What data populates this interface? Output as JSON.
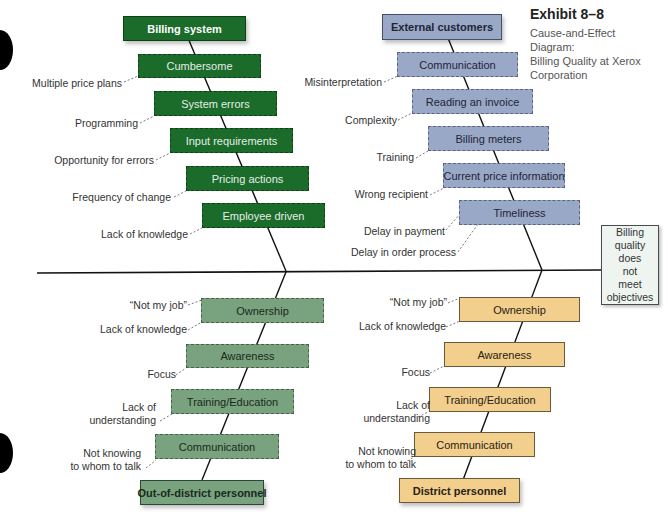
{
  "exhibit": {
    "number": "Exhibit 8–8",
    "caption_line1": "Cause-and-Effect Diagram:",
    "caption_line2": "Billing Quality at Xerox",
    "caption_line3": "Corporation"
  },
  "effect": {
    "lines": [
      "Billing",
      "quality",
      "does",
      "not",
      "meet",
      "objectives"
    ]
  },
  "colors": {
    "billing_system": "#1b6b2a",
    "external_customers": "#9aa8c8",
    "out_of_district": "#79a37e",
    "district": "#f2cf8c",
    "spine": "#111111"
  },
  "branches": {
    "billing_system": {
      "title": "Billing system",
      "categories": [
        "Cumbersome",
        "System errors",
        "Input requirements",
        "Pricing actions",
        "Employee driven"
      ],
      "causes": [
        "Multiple price plans",
        "Programming",
        "Opportunity for errors",
        "Frequency of change",
        "Lack of knowledge"
      ]
    },
    "external_customers": {
      "title": "External customers",
      "categories": [
        "Communication",
        "Reading an invoice",
        "Billing meters",
        "Current price information",
        "Timeliness"
      ],
      "causes": [
        "Misinterpretation",
        "Complexity",
        "Training",
        "Wrong recipient",
        "Delay in payment",
        "Delay in order process"
      ]
    },
    "out_of_district": {
      "title": "Out-of-district personnel",
      "categories": [
        "Ownership",
        "Awareness",
        "Training/Education",
        "Communication"
      ],
      "causes": [
        "“Not my job”",
        "Lack of knowledge",
        "Focus",
        "Lack of",
        "understanding",
        "Not knowing",
        "to whom to talk"
      ]
    },
    "district": {
      "title": "District personnel",
      "categories": [
        "Ownership",
        "Awareness",
        "Training/Education",
        "Communication"
      ],
      "causes": [
        "“Not my job”",
        "Lack of knowledge",
        "Focus",
        "Lack of",
        "understanding",
        "Not knowing",
        "to whom to talk"
      ]
    }
  }
}
